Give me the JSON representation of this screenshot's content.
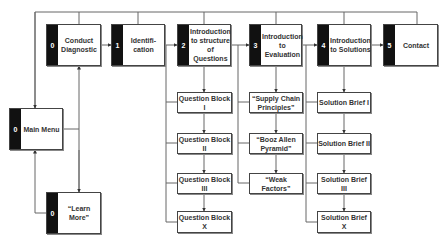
{
  "diagram": {
    "type": "flowchart",
    "main_nodes": [
      {
        "id": "conduct",
        "num": "0",
        "label": "Conduct Diagnostic"
      },
      {
        "id": "ident",
        "num": "1",
        "label": "Identifi-cation"
      },
      {
        "id": "intro-q",
        "num": "2",
        "label": "Introduction to structure of Questions"
      },
      {
        "id": "intro-eval",
        "num": "3",
        "label": "Introduction to Evaluation"
      },
      {
        "id": "intro-sol",
        "num": "4",
        "label": "Introduction to Solutions"
      },
      {
        "id": "contact",
        "num": "5",
        "label": "Contact"
      }
    ],
    "main_menu": {
      "num": "0",
      "label": "Main Menu"
    },
    "learn_more": {
      "num": "0",
      "label": "“Learn More”"
    },
    "questions": [
      "Question Block I",
      "Question Block II",
      "Question Block III",
      "Question Block X"
    ],
    "evaluation": [
      "“Supply Chain Principles”",
      "“Booz Allen Pyramid”",
      "“Weak Factors”"
    ],
    "solutions": [
      "Solution Brief I",
      "Solution Brief II",
      "Solution Brief III",
      "Solution Brief X"
    ]
  }
}
